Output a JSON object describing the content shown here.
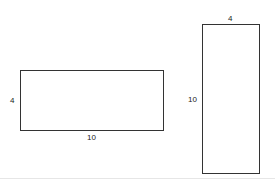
{
  "diagram": {
    "shapes": [
      {
        "name": "horizontal-rectangle",
        "width_label": "10",
        "height_label": "4"
      },
      {
        "name": "vertical-rectangle",
        "width_label": "4",
        "height_label": "10"
      }
    ],
    "colors": {
      "stroke": "#333333",
      "background": "#ffffff"
    }
  }
}
